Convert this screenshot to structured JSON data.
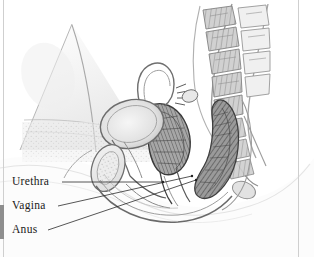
{
  "figure": {
    "medium": "pencil-sketch",
    "background_color": "#ffffff",
    "ink_color": "#1a1a1a",
    "shade_dark": "#6f6f6f",
    "shade_mid": "#9a9a9a",
    "shade_light": "#d6d6d6",
    "shade_faint": "#ececec"
  },
  "labels": [
    {
      "id": "urethra",
      "text": "Urethra",
      "x": 12,
      "y": 176,
      "leader": {
        "x1": 62,
        "y1": 182,
        "x2": 163,
        "y2": 182
      }
    },
    {
      "id": "vagina",
      "text": "Vagina",
      "x": 12,
      "y": 200,
      "leader": {
        "x1": 58,
        "y1": 206,
        "x2": 192,
        "y2": 176
      }
    },
    {
      "id": "anus",
      "text": "Anus",
      "x": 12,
      "y": 224,
      "leader": {
        "x1": 48,
        "y1": 230,
        "x2": 196,
        "y2": 180
      }
    }
  ],
  "structures": [
    {
      "name": "spine-vertebrae",
      "region": "top-right"
    },
    {
      "name": "sacrum",
      "region": "right"
    },
    {
      "name": "rectum",
      "region": "right-center",
      "tone": "dark"
    },
    {
      "name": "uterus",
      "region": "center",
      "tone": "dark"
    },
    {
      "name": "bladder",
      "region": "center-left",
      "tone": "light"
    },
    {
      "name": "pubic-bone",
      "region": "lower-left"
    },
    {
      "name": "abdominal-wall-triangle",
      "region": "upper-left"
    }
  ],
  "edges": {
    "left_rule": "#cfcfcf",
    "right_rule": "#cfcfcf",
    "left_tab": "#8e8e8e"
  }
}
